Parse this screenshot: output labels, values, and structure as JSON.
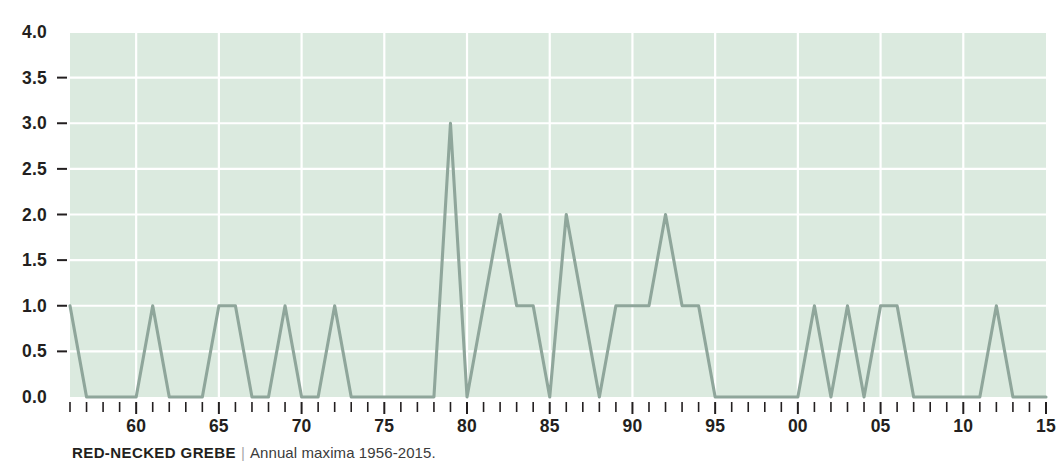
{
  "caption": {
    "species": "RED-NECKED GREBE",
    "divider": "|",
    "subtitle": "Annual maxima 1956-2015."
  },
  "colors": {
    "plot_background": "#dbeadf",
    "gridline": "#ffffff",
    "series_line": "#8fa69b",
    "text": "#231f20",
    "divider": "#a8a8a8"
  },
  "chart_data": {
    "type": "line",
    "title": "RED-NECKED GREBE",
    "subtitle": "Annual maxima 1956-2015.",
    "xlabel": "",
    "ylabel": "",
    "grid": true,
    "legend": false,
    "xlim": [
      1956,
      2015
    ],
    "ylim": [
      0.0,
      4.0
    ],
    "ytick_labels": [
      "0.0",
      "0.5",
      "1.0",
      "1.5",
      "2.0",
      "2.5",
      "3.0",
      "3.5",
      "4.0"
    ],
    "ytick_values": [
      0.0,
      0.5,
      1.0,
      1.5,
      2.0,
      2.5,
      3.0,
      3.5,
      4.0
    ],
    "xtick_labels": [
      "60",
      "65",
      "70",
      "75",
      "80",
      "85",
      "90",
      "95",
      "00",
      "05",
      "10",
      "15"
    ],
    "xtick_values": [
      1960,
      1965,
      1970,
      1975,
      1980,
      1985,
      1990,
      1995,
      2000,
      2005,
      2010,
      2015
    ],
    "x": [
      1956,
      1957,
      1958,
      1959,
      1960,
      1961,
      1962,
      1963,
      1964,
      1965,
      1966,
      1967,
      1968,
      1969,
      1970,
      1971,
      1972,
      1973,
      1974,
      1975,
      1976,
      1977,
      1978,
      1979,
      1980,
      1981,
      1982,
      1983,
      1984,
      1985,
      1986,
      1987,
      1988,
      1989,
      1990,
      1991,
      1992,
      1993,
      1994,
      1995,
      1996,
      1997,
      1998,
      1999,
      2000,
      2001,
      2002,
      2003,
      2004,
      2005,
      2006,
      2007,
      2008,
      2009,
      2010,
      2011,
      2012,
      2013,
      2014,
      2015
    ],
    "values": [
      1,
      0,
      0,
      0,
      0,
      1,
      0,
      0,
      0,
      1,
      1,
      0,
      0,
      1,
      0,
      0,
      1,
      0,
      0,
      0,
      0,
      0,
      0,
      3,
      0,
      1,
      2,
      1,
      1,
      0,
      2,
      1,
      0,
      1,
      1,
      1,
      2,
      1,
      1,
      0,
      0,
      0,
      0,
      0,
      0,
      1,
      0,
      1,
      0,
      1,
      1,
      0,
      0,
      0,
      0,
      0,
      1,
      0,
      0,
      0
    ],
    "series": [
      {
        "name": "Annual maxima",
        "values": [
          1,
          0,
          0,
          0,
          0,
          1,
          0,
          0,
          0,
          1,
          1,
          0,
          0,
          1,
          0,
          0,
          1,
          0,
          0,
          0,
          0,
          0,
          0,
          3,
          0,
          1,
          2,
          1,
          1,
          0,
          2,
          1,
          0,
          1,
          1,
          1,
          2,
          1,
          1,
          0,
          0,
          0,
          0,
          0,
          0,
          1,
          0,
          1,
          0,
          1,
          1,
          0,
          0,
          0,
          0,
          0,
          1,
          0,
          0,
          0
        ]
      }
    ]
  }
}
